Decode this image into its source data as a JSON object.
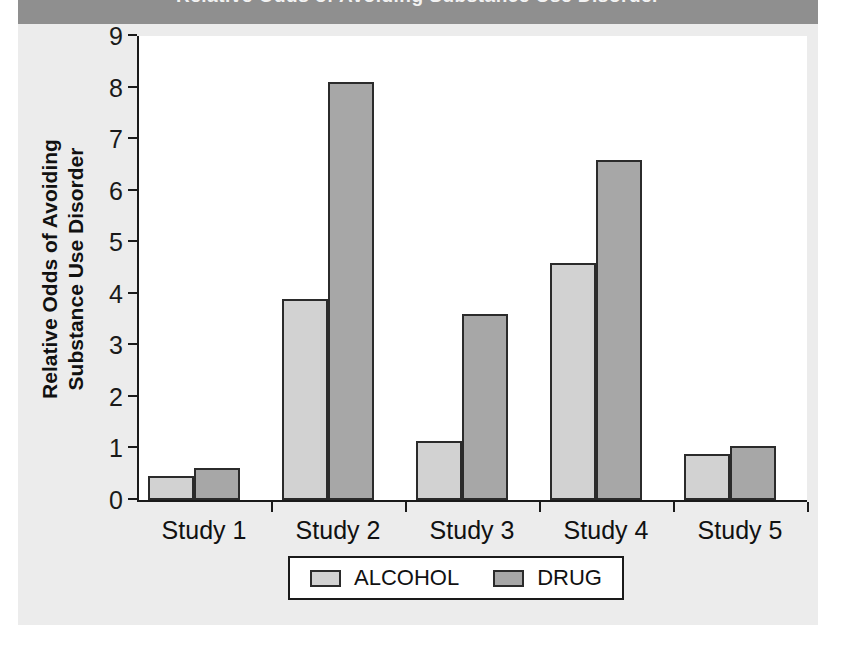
{
  "header": {
    "band_text": "Relative Odds of Avoiding Substance Use Disorder"
  },
  "chart_data": {
    "type": "bar",
    "title": "",
    "xlabel": "",
    "ylabel": "Relative Odds of Avoiding Substance Use Disorder",
    "ylabel_line1": "Relative Odds of Avoiding",
    "ylabel_line2": "Substance Use Disorder",
    "categories": [
      "Study 1",
      "Study 2",
      "Study 3",
      "Study 4",
      "Study 5"
    ],
    "series": [
      {
        "name": "ALCOHOL",
        "color": "#d2d2d2",
        "values": [
          0.47,
          3.9,
          1.15,
          4.6,
          0.9
        ]
      },
      {
        "name": "DRUG",
        "color": "#a7a7a7",
        "values": [
          0.62,
          8.1,
          3.6,
          6.6,
          1.05
        ]
      }
    ],
    "ylim": [
      0,
      9
    ],
    "yticks": [
      0,
      1,
      2,
      3,
      4,
      5,
      6,
      7,
      8,
      9
    ],
    "ytick_labels": [
      "0",
      "1",
      "2",
      "3",
      "4",
      "5",
      "6",
      "7",
      "8",
      "9"
    ],
    "grid": false,
    "legend_position": "bottom-center"
  },
  "legend": {
    "entries": [
      {
        "label": "ALCOHOL",
        "color": "#d2d2d2"
      },
      {
        "label": "DRUG",
        "color": "#a7a7a7"
      }
    ]
  },
  "colors": {
    "alcohol": "#d2d2d2",
    "drug": "#a7a7a7",
    "axis": "#1a1a1a",
    "bar_border": "#2b2b2b",
    "panel": "#ececec",
    "header_band": "#8f8f8f",
    "plot_background": "#ffffff"
  }
}
